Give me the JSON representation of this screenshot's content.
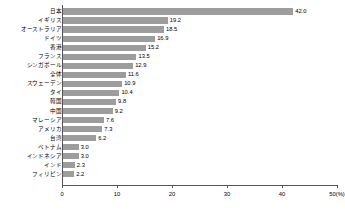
{
  "chart_data": {
    "type": "bar",
    "orientation": "horizontal",
    "title": "",
    "subtitle": "",
    "xlabel": "",
    "ylabel": "",
    "unit_label": "(%)",
    "xlim": [
      0,
      50
    ],
    "xticks": [
      0,
      10,
      20,
      30,
      40,
      50
    ],
    "xtick_labels": [
      "0",
      "10",
      "20",
      "30",
      "40",
      "50(%)"
    ],
    "grid": false,
    "legend": null,
    "bar_color": "#9d9d9d",
    "axis_color": "#555555",
    "categories": [
      "日本",
      "イギリス",
      "オーストラリア",
      "ドイツ",
      "香港",
      "フランス",
      "シンガポール",
      "全体",
      "スウェーデン",
      "タイ",
      "韓国",
      "中国",
      "マレーシア",
      "アメリカ",
      "台湾",
      "ベトナム",
      "インドネシア",
      "インド",
      "フィリピン"
    ],
    "values": [
      42.0,
      19.2,
      18.5,
      16.9,
      15.2,
      13.5,
      12.9,
      11.6,
      10.9,
      10.4,
      9.8,
      9.2,
      7.6,
      7.3,
      6.2,
      3.0,
      3.0,
      2.3,
      2.2
    ],
    "value_labels": [
      "42.0",
      "19.2",
      "18.5",
      "16.9",
      "15.2",
      "13.5",
      "12.9",
      "11.6",
      "10.9",
      "10.4",
      "9.8",
      "9.2",
      "7.6",
      "7.3",
      "6.2",
      "3.0",
      "3.0",
      "2.3",
      "2.2"
    ]
  }
}
